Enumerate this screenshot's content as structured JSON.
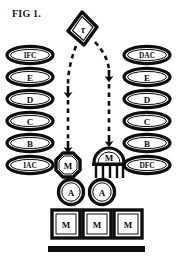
{
  "figure": {
    "caption": "FIG 1.",
    "background_color": "#ffffff",
    "ink_color": "#0d0d0d"
  },
  "source_node": {
    "shape": "diamond",
    "label": "τ",
    "name": "tau-source"
  },
  "left_column": {
    "name": "left-pathway-column",
    "items": [
      {
        "label": "IFC",
        "shape": "ellipse",
        "small": true
      },
      {
        "label": "E",
        "shape": "ellipse",
        "small": false
      },
      {
        "label": "D",
        "shape": "ellipse",
        "small": false
      },
      {
        "label": "C",
        "shape": "ellipse",
        "small": false
      },
      {
        "label": "B",
        "shape": "ellipse",
        "small": false
      },
      {
        "label": "IAC",
        "shape": "ellipse",
        "small": true
      }
    ]
  },
  "right_column": {
    "name": "right-pathway-column",
    "items": [
      {
        "label": "DAC",
        "shape": "ellipse",
        "small": true
      },
      {
        "label": "E",
        "shape": "ellipse",
        "small": false
      },
      {
        "label": "D",
        "shape": "ellipse",
        "small": false
      },
      {
        "label": "C",
        "shape": "ellipse",
        "small": false
      },
      {
        "label": "B",
        "shape": "ellipse",
        "small": false
      },
      {
        "label": "DFC",
        "shape": "ellipse",
        "small": true
      }
    ]
  },
  "center_column": {
    "name": "center-stack",
    "octagon_node": {
      "label": "M",
      "shape": "octagon"
    },
    "dome_node": {
      "label": "M",
      "shape": "dome-with-legs"
    },
    "circle_nodes": [
      {
        "label": "A",
        "shape": "circle"
      },
      {
        "label": "A",
        "shape": "circle"
      }
    ],
    "square_nodes": [
      {
        "label": "M",
        "shape": "square"
      },
      {
        "label": "M",
        "shape": "square"
      },
      {
        "label": "M",
        "shape": "square"
      }
    ],
    "base_bar": {
      "shape": "bar"
    }
  },
  "connectors": [
    {
      "name": "arrow-left",
      "style": "dashed",
      "arrowheads": 2
    },
    {
      "name": "arrow-right",
      "style": "dashed",
      "arrowheads": 2
    }
  ]
}
